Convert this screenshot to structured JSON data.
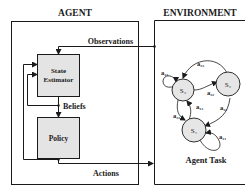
{
  "agent": {
    "title": "AGENT",
    "state_estimator_label_line1": "State",
    "state_estimator_label_line2": "Estimator",
    "policy_label": "Policy",
    "beliefs_label": "Beliefs"
  },
  "environment": {
    "title": "ENVIRONMENT",
    "caption": "Agent Task",
    "states": [
      {
        "id": "s3",
        "label": "S₃"
      },
      {
        "id": "s2",
        "label": "S₂"
      },
      {
        "id": "s1",
        "label": "S₁"
      }
    ],
    "transitions": [
      {
        "label": "a₃₃"
      },
      {
        "label": "a₂₃"
      },
      {
        "label": "a₃₂"
      },
      {
        "label": "a₁₃"
      },
      {
        "label": "a₃₁"
      },
      {
        "label": "a₁₂"
      },
      {
        "label": "a₁₁"
      }
    ]
  },
  "flows": {
    "observations_label": "Observations",
    "actions_label": "Actions"
  },
  "colors": {
    "box_fill": "#e4e4e4",
    "node_fill": "#e6e6e6",
    "stroke": "#1a1a1a"
  }
}
